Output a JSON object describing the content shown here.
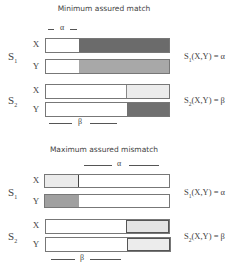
{
  "panels": [
    {
      "title": "Minimum assured match",
      "alpha_label": "α",
      "beta_label": "β",
      "groups": [
        {
          "label": "S",
          "sub": "1",
          "equation": {
            "prefix": "S",
            "sub": "1",
            "rest": "(X,Y) = α"
          },
          "rows": [
            {
              "label": "X",
              "fill_start": 78,
              "fill_end": 170,
              "fill_color": "#6b6b6b"
            },
            {
              "label": "Y",
              "fill_start": 78,
              "fill_end": 170,
              "fill_color": "#a8a8a8"
            }
          ]
        },
        {
          "label": "S",
          "sub": "2",
          "equation": {
            "prefix": "S",
            "sub": "2",
            "rest": "(X,Y) = β"
          },
          "rows": [
            {
              "label": "X",
              "fill_start": 125,
              "fill_end": 170,
              "fill_color": "#ececec"
            },
            {
              "label": "Y",
              "fill_start": 126,
              "fill_end": 170,
              "fill_color": "#707070"
            }
          ]
        }
      ]
    },
    {
      "title": "Maximum assured mismatch",
      "alpha_label": "α",
      "beta_label": "β",
      "groups": [
        {
          "label": "S",
          "sub": "1",
          "equation": {
            "prefix": "S",
            "sub": "1",
            "rest": "(X,Y) = α"
          },
          "rows": [
            {
              "label": "X",
              "fill_start": 45,
              "fill_end": 78,
              "fill_color": "#ebebeb"
            },
            {
              "label": "Y",
              "fill_start": 45,
              "fill_end": 78,
              "fill_color": "#a0a0a0"
            }
          ]
        },
        {
          "label": "S",
          "sub": "2",
          "equation": {
            "prefix": "S",
            "sub": "2",
            "rest": "(X,Y) = β"
          },
          "rows": [
            {
              "label": "X",
              "fill_start": 125,
              "fill_end": 170,
              "fill_color": "#e4e4e4"
            },
            {
              "label": "Y",
              "fill_start": 126,
              "fill_end": 171,
              "fill_color": "#ececec"
            }
          ]
        }
      ]
    }
  ]
}
